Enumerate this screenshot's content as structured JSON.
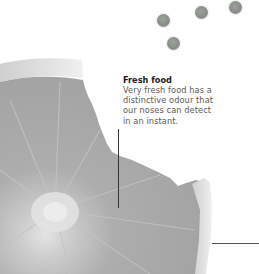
{
  "callout": {
    "title": "Fresh food",
    "lines": [
      "Very fresh food has a",
      "distinctive odour that",
      "our noses can detect",
      "in an instant."
    ]
  },
  "illustration": {
    "subject": "orange-slice-with-bite",
    "scent_particles": 4,
    "colors": {
      "flesh": "#a9a9a9",
      "rind": "#d9d9d9",
      "particle": "#8e928c",
      "leader_line": "#333333",
      "title_text": "#1a1a1a",
      "body_text": "#5a5a5a"
    }
  }
}
